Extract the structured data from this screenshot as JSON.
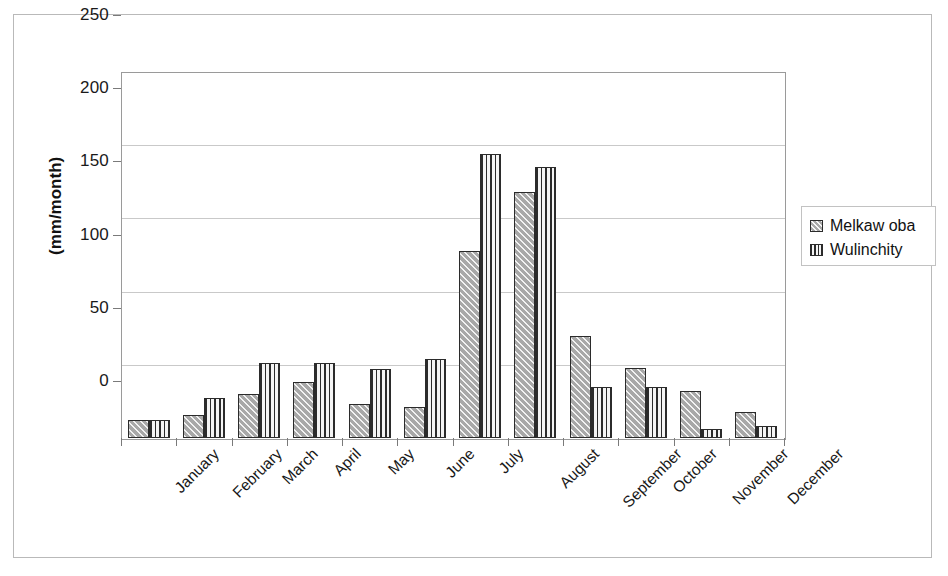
{
  "chart_data": {
    "type": "bar",
    "title": "",
    "subtitle": "",
    "xlabel": "",
    "ylabel": "(mm/month)",
    "ylim": [
      0,
      250
    ],
    "yticks": [
      0,
      50,
      100,
      150,
      200,
      250
    ],
    "grid": true,
    "legend_position": "right",
    "categories": [
      "January",
      "February",
      "March",
      "April",
      "May",
      "June",
      "July",
      "August",
      "September",
      "October",
      "November",
      "December"
    ],
    "series": [
      {
        "name": "Melkaw oba",
        "pattern": "diagonal-hatch",
        "values": [
          12,
          16,
          30,
          38,
          23,
          21,
          128,
          168,
          70,
          48,
          32,
          18
        ]
      },
      {
        "name": "Wulinchity",
        "pattern": "vertical-lines",
        "values": [
          12,
          27,
          51,
          51,
          47,
          54,
          194,
          185,
          35,
          35,
          6,
          8
        ]
      }
    ],
    "annotations": []
  },
  "legend": {
    "items": [
      {
        "label": "Melkaw oba"
      },
      {
        "label": "Wulinchity"
      }
    ]
  }
}
